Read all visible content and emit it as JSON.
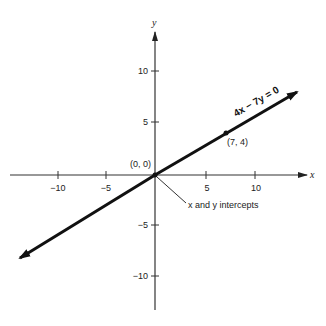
{
  "diagram": {
    "axes": {
      "x_label": "x",
      "y_label": "y",
      "x_ticks": [
        {
          "value": -10,
          "label": "−10"
        },
        {
          "value": -5,
          "label": "−5"
        },
        {
          "value": 5,
          "label": "5"
        },
        {
          "value": 10,
          "label": "10"
        }
      ],
      "y_ticks": [
        {
          "value": 10,
          "label": "10"
        },
        {
          "value": 5,
          "label": "5"
        },
        {
          "value": -5,
          "label": "−5"
        },
        {
          "value": -10,
          "label": "−10"
        }
      ]
    },
    "line": {
      "equation": "4x − 7y = 0",
      "color": "#111111"
    },
    "points": [
      {
        "label": "(0, 0)",
        "x": 0,
        "y": 0
      },
      {
        "label": "(7, 4)",
        "x": 7,
        "y": 4
      }
    ],
    "annotation": "x and y intercepts"
  }
}
